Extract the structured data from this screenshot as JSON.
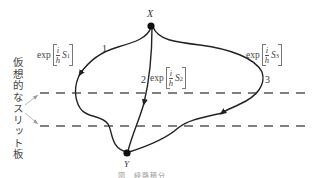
{
  "diagram": {
    "type": "path-integral-paths",
    "points": {
      "start": {
        "label": "X"
      },
      "end": {
        "label": "Y"
      }
    },
    "paths": [
      {
        "id": "1",
        "number_label": "1",
        "phase_prefix": "exp",
        "frac_num": "i",
        "frac_den": "h",
        "action_symbol": "S",
        "action_sub": "1"
      },
      {
        "id": "2",
        "number_label": "2",
        "phase_prefix": "exp",
        "frac_num": "i",
        "frac_den": "h",
        "action_symbol": "S",
        "action_sub": "2"
      },
      {
        "id": "3",
        "number_label": "3",
        "phase_prefix": "exp",
        "frac_num": "i",
        "frac_den": "h",
        "action_symbol": "S",
        "action_sub": "3"
      }
    ],
    "slit_plates_label": "仮想的なスリット板",
    "caption": "図　経路積分"
  },
  "colors": {
    "line": "#222222",
    "dashed": "#555555",
    "pointer": "#999999",
    "text": "#333333"
  }
}
